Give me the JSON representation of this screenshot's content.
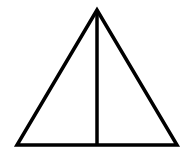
{
  "diagram": {
    "shape": "triangle-with-altitude",
    "stroke_color": "#000000",
    "background": "#ffffff",
    "stroke_width": 3.5,
    "apex": [
      97,
      10
    ],
    "base_left": [
      17,
      145
    ],
    "base_right": [
      177,
      145
    ],
    "altitude_foot": [
      97,
      145
    ]
  }
}
